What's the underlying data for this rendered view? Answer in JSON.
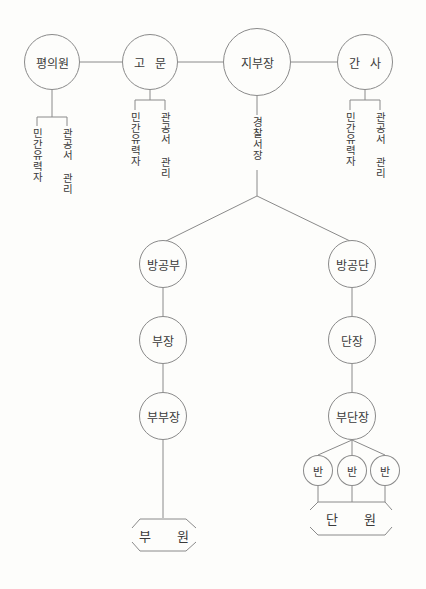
{
  "top_row": [
    {
      "id": "pyeonguiwon",
      "label": "평의원"
    },
    {
      "id": "gomun",
      "label": "고 문"
    },
    {
      "id": "jibujang",
      "label": "지부장"
    },
    {
      "id": "gansa",
      "label": "간 사"
    }
  ],
  "top_sub_labels": {
    "pyeonguiwon": [
      "민간유력자",
      "관공서 관리"
    ],
    "gomun": [
      "민간유력자",
      "관공서 관리"
    ],
    "gansa": [
      "민간유력자",
      "관공서 관리"
    ]
  },
  "jibujang_sub_label": "경찰서장",
  "left_branch": {
    "nodes": [
      "방공부",
      "부장",
      "부부장"
    ],
    "members": "부 원"
  },
  "right_branch": {
    "nodes": [
      "방공단",
      "단장",
      "부단장"
    ],
    "squads": [
      "반",
      "반",
      "반"
    ],
    "members": "단 원"
  }
}
